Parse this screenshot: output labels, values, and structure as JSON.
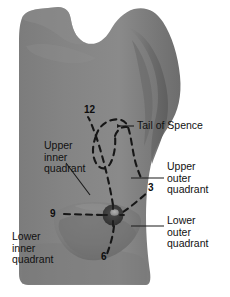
{
  "figure": {
    "background_color": "#ffffff",
    "view": "lateral oblique female torso with left breast"
  },
  "colors": {
    "background": "#ffffff",
    "torso_base": "#808080",
    "torso_shadow": "#6b6b6b",
    "torso_highlight": "#8e8e8e",
    "breast_shadow": "#6f6f6f",
    "areola": "#3a3a3a",
    "nipple": "#9a9a9a",
    "dashed_line": "#161616",
    "leader_line": "#1a1a1a",
    "text": "#111111"
  },
  "labels": {
    "tail_of_spence": "Tail of Spence",
    "upper_inner_quadrant": "Upper\ninner\nquadrant",
    "upper_outer_quadrant": "Upper\nouter\nquadrant",
    "lower_outer_quadrant": "Lower\nouter\nquadrant",
    "lower_inner_quadrant": "Lower\ninner\nquadrant"
  },
  "clock_markers": [
    {
      "id": "twelve",
      "value": "12",
      "position": "top",
      "x": 88,
      "y": 110
    },
    {
      "id": "three",
      "value": "3",
      "position": "outer-right",
      "x": 150,
      "y": 188
    },
    {
      "id": "six",
      "value": "6",
      "position": "bottom",
      "x": 104,
      "y": 255
    },
    {
      "id": "nine",
      "value": "9",
      "position": "inner-left",
      "x": 54,
      "y": 212
    }
  ],
  "anatomy": {
    "nipple_center": {
      "x": 113,
      "y": 215
    },
    "areola_radius": 10,
    "quadrant_divider_style": "dashed",
    "tail_of_spence_shape": "dashed teardrop loop toward axilla"
  },
  "leader_lines": [
    {
      "name": "tail-of-spence-leader",
      "from": [
        135,
        126
      ],
      "to": [
        119,
        126
      ]
    },
    {
      "name": "upper-inner-leader",
      "from": [
        66,
        162
      ],
      "to": [
        89,
        194
      ]
    },
    {
      "name": "upper-outer-leader",
      "from": [
        163,
        178
      ],
      "to": [
        131,
        178
      ]
    },
    {
      "name": "lower-outer-leader",
      "from": [
        163,
        226
      ],
      "to": [
        131,
        226
      ]
    }
  ]
}
